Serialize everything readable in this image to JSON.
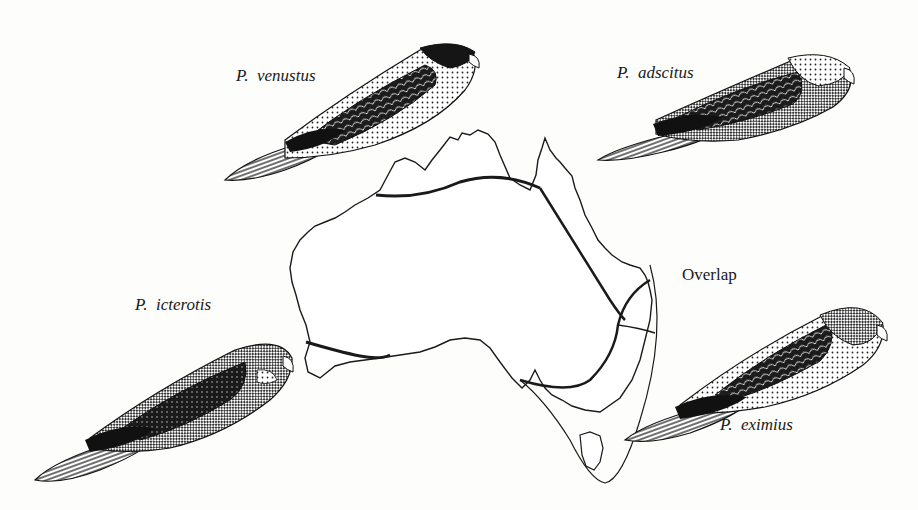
{
  "figure": {
    "species": [
      {
        "id": "venustus",
        "genus_abbrev": "P.",
        "epithet": "venustus",
        "region": "northern Australia"
      },
      {
        "id": "adscitus",
        "genus_abbrev": "P.",
        "epithet": "adscitus",
        "region": "north-eastern Australia"
      },
      {
        "id": "icterotis",
        "genus_abbrev": "P.",
        "epithet": "icterotis",
        "region": "south-western Australia"
      },
      {
        "id": "eximius",
        "genus_abbrev": "P.",
        "epithet": "eximius",
        "region": "south-eastern Australia and Tasmania"
      }
    ],
    "annotations": {
      "overlap": "Overlap"
    }
  }
}
